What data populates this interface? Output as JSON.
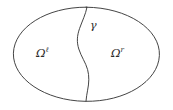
{
  "figure": {
    "name": "domain-decomposition-diagram",
    "background_color": "#ffffff",
    "stroke_color": "#3a3a3a",
    "label_color": "#2b2b2b",
    "width": 173,
    "height": 110
  },
  "labels": {
    "omega_left": {
      "base": "Ω",
      "superscript": "ℓ",
      "full": "Ωℓ"
    },
    "omega_right": {
      "base": "Ω",
      "superscript": "r",
      "full": "Ωr"
    },
    "interface": {
      "full": "γ"
    }
  },
  "shapes": {
    "outer_boundary": {
      "type": "ellipse",
      "center_x": 86,
      "center_y": 54,
      "radius_x": 73,
      "radius_y": 47
    },
    "interface_curve": {
      "type": "path",
      "start_x": 87,
      "start_y": 7,
      "end_x": 86,
      "end_y": 101
    }
  }
}
